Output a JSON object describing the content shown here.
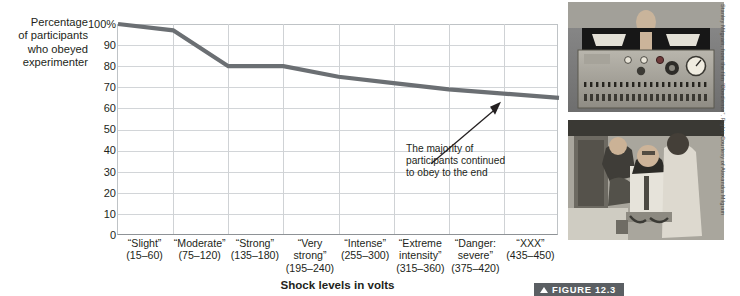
{
  "chart_data": {
    "type": "line",
    "title": "",
    "xlabel": "Shock levels in volts",
    "ylabel": "Percentage of participants who obeyed experimenter",
    "ylim": [
      0,
      100
    ],
    "ytick_labels": [
      "100%",
      "90",
      "80",
      "70",
      "60",
      "50",
      "40",
      "30",
      "20",
      "10",
      "0"
    ],
    "ytick_values": [
      100,
      90,
      80,
      70,
      60,
      50,
      40,
      30,
      20,
      10,
      0
    ],
    "grid": true,
    "legend": "none",
    "categories": [
      "“Slight” (15–60)",
      "“Moderate” (75–120)",
      "“Strong” (135–180)",
      "“Very strong” (195–240)",
      "“Intense” (255–300)",
      "“Extreme intensity” (315–360)",
      "“Danger: severe” (375–420)",
      "“XXX” (435–450)"
    ],
    "values": [
      100,
      97,
      80,
      80,
      75,
      72,
      69,
      65
    ],
    "series_color": "#6b6f73",
    "annotations": [
      {
        "text": "The majority of participants continued to obey to the end",
        "points_to_category": "“XXX” (435–450)",
        "points_to_value": 65
      }
    ]
  },
  "y_axis": {
    "caption_lines": [
      "Percentage",
      "of participants",
      "who obeyed",
      "experimenter"
    ],
    "ticks": [
      "100%",
      "90",
      "80",
      "70",
      "60",
      "50",
      "40",
      "30",
      "20",
      "10",
      "0"
    ]
  },
  "x_axis": {
    "title": "Shock levels in volts",
    "categories": [
      {
        "name": "“Slight”",
        "lines": [
          "“Slight”",
          "(15–60)"
        ]
      },
      {
        "name": "“Moderate”",
        "lines": [
          "“Moderate”",
          "(75–120)"
        ]
      },
      {
        "name": "“Strong”",
        "lines": [
          "“Strong”",
          "(135–180)"
        ]
      },
      {
        "name": "“Very strong”",
        "lines": [
          "“Very",
          "strong”",
          "(195–240)"
        ]
      },
      {
        "name": "“Intense”",
        "lines": [
          "“Intense”",
          "(255–300)"
        ]
      },
      {
        "name": "“Extreme intensity”",
        "lines": [
          "“Extreme",
          "intensity”",
          "(315–360)"
        ]
      },
      {
        "name": "“Danger: severe”",
        "lines": [
          "“Danger:",
          "severe”",
          "(375–420)"
        ]
      },
      {
        "name": "“XXX”",
        "lines": [
          "“XXX”",
          "(435–450)"
        ]
      }
    ]
  },
  "annotation": {
    "lines": [
      "The majority of",
      "participants continued",
      "to obey to the end"
    ]
  },
  "photos": {
    "top": {
      "alt": "Experimenter seated behind the shock generator console"
    },
    "bottom": {
      "alt": "Learner being strapped into the chair with electrodes by two men"
    },
    "credit": "Stanley Milgram, from the film “Obedience”. Rights Courtesy of Alexandra Milgram"
  },
  "figure_caption": {
    "label": "FIGURE 12.3"
  }
}
